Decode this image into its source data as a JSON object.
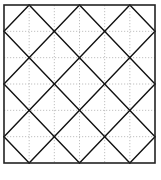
{
  "diagram": {
    "type": "square-grid-with-diamond-lattice",
    "grid": {
      "columns": 6,
      "rows": 6,
      "gridline_style": "dotted",
      "gridline_color": "#b0b0b0"
    },
    "frame": {
      "x": 4,
      "y": 5,
      "width": 151,
      "height": 158,
      "stroke_color": "#222222",
      "stroke_width": 1.6
    },
    "diagonal_lines": {
      "stroke_color": "#111111",
      "stroke_width": 1.4,
      "description": "Lines with slope ±1 in grid units passing through odd grid points, forming a lattice of diamonds",
      "segments_grid_units": [
        [
          [
            0,
            1
          ],
          [
            1,
            0
          ]
        ],
        [
          [
            0,
            3
          ],
          [
            3,
            0
          ]
        ],
        [
          [
            0,
            5
          ],
          [
            5,
            0
          ]
        ],
        [
          [
            1,
            6
          ],
          [
            6,
            1
          ]
        ],
        [
          [
            3,
            6
          ],
          [
            6,
            3
          ]
        ],
        [
          [
            5,
            6
          ],
          [
            6,
            5
          ]
        ],
        [
          [
            1,
            0
          ],
          [
            6,
            5
          ]
        ],
        [
          [
            3,
            0
          ],
          [
            6,
            3
          ]
        ],
        [
          [
            5,
            0
          ],
          [
            6,
            1
          ]
        ],
        [
          [
            0,
            1
          ],
          [
            5,
            6
          ]
        ],
        [
          [
            0,
            3
          ],
          [
            3,
            6
          ]
        ],
        [
          [
            0,
            5
          ],
          [
            1,
            6
          ]
        ]
      ]
    }
  },
  "watermark": {
    "text": "",
    "color": "#e4e4e4"
  }
}
